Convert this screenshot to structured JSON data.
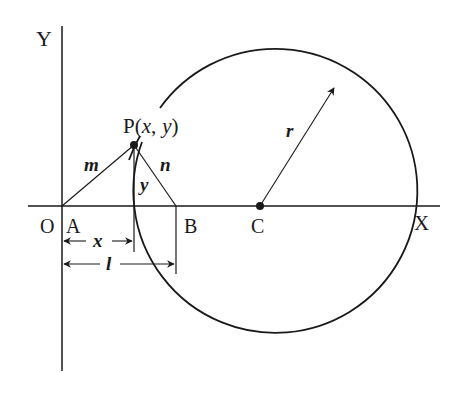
{
  "diagram": {
    "axis_labels": {
      "y": "Y",
      "x": "X",
      "origin": "O"
    },
    "points": {
      "A": "A",
      "B": "B",
      "C": "C",
      "P": "P"
    },
    "P_coords": {
      "open": "(",
      "x": "x",
      "comma": ",",
      "y": "y",
      "close": ")"
    },
    "segment_labels": {
      "m": "m",
      "n": "n",
      "y": "y",
      "x": "x",
      "l": "l",
      "r": "r"
    },
    "stroke_color": "#1a1a1a"
  }
}
